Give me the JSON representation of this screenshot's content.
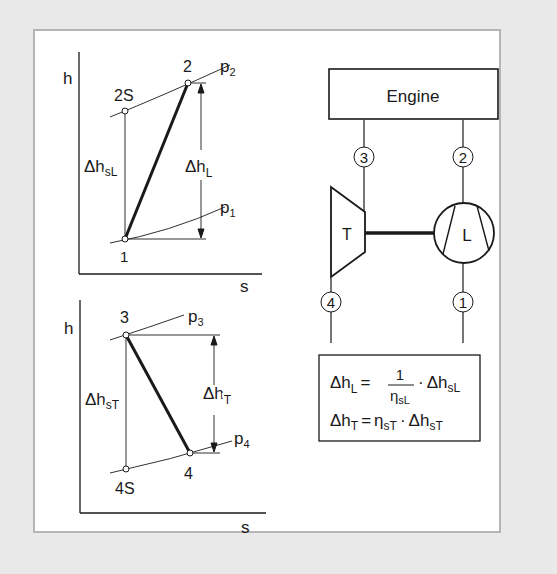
{
  "diagram": {
    "compressor_chart": {
      "y_axis": "h",
      "x_axis": "s",
      "points": {
        "p1": "1",
        "p2": "2",
        "p2s": "2S"
      },
      "isobars": {
        "low": "p",
        "low_sub": "1",
        "high": "p",
        "high_sub": "2"
      },
      "delta_isentropic": {
        "main": "Δh",
        "sub": "sL"
      },
      "delta_actual": {
        "main": "Δh",
        "sub": "L"
      }
    },
    "turbine_chart": {
      "y_axis": "h",
      "x_axis": "s",
      "points": {
        "p3": "3",
        "p4": "4",
        "p4s": "4S"
      },
      "isobars": {
        "high": "p",
        "high_sub": "3",
        "low": "p",
        "low_sub": "4"
      },
      "delta_isentropic": {
        "main": "Δh",
        "sub": "sT"
      },
      "delta_actual": {
        "main": "Δh",
        "sub": "T"
      }
    },
    "schematic": {
      "engine_label": "Engine",
      "turbine_label": "T",
      "compressor_label": "L",
      "station_labels": {
        "s1": "1",
        "s2": "2",
        "s3": "3",
        "s4": "4"
      }
    },
    "formulas": {
      "f1": {
        "lhs": "Δh",
        "lhs_sub": "L",
        "eq": "=",
        "num": "1",
        "den": "η",
        "den_sub": "sL",
        "dot": "·",
        "rhs": "Δh",
        "rhs_sub": "sL"
      },
      "f2": {
        "lhs": "Δh",
        "lhs_sub": "T",
        "eq": "=",
        "eta": "η",
        "eta_sub": "sT",
        "dot": "·",
        "rhs": "Δh",
        "rhs_sub": "sT"
      }
    }
  }
}
